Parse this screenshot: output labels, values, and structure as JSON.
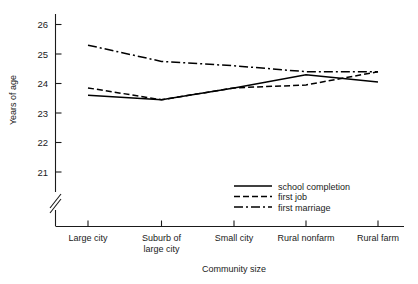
{
  "chart_data": {
    "type": "line",
    "title": "",
    "xlabel": "Community size",
    "ylabel": "Years of age",
    "categories": [
      "Large city",
      "Suburb of large city",
      "Small city",
      "Rural nonfarm",
      "Rural farm"
    ],
    "category_lines": [
      [
        "Large city"
      ],
      [
        "Suburb of",
        "large city"
      ],
      [
        "Small city"
      ],
      [
        "Rural nonfarm"
      ],
      [
        "Rural farm"
      ]
    ],
    "ylim": [
      20.6,
      26.4
    ],
    "yticks": [
      21,
      22,
      23,
      24,
      25,
      26
    ],
    "ytick_labels": [
      "21",
      "22",
      "23",
      "24",
      "25",
      "26"
    ],
    "y_axis_break": true,
    "grid": false,
    "legend_position": "inside-lower-right",
    "series": [
      {
        "name": "school completion",
        "style": "solid",
        "values": [
          23.6,
          23.45,
          23.85,
          24.3,
          24.05
        ]
      },
      {
        "name": "first job",
        "style": "dashed",
        "values": [
          23.85,
          23.45,
          23.85,
          23.95,
          24.4
        ]
      },
      {
        "name": "first marriage",
        "style": "dash-dot",
        "values": [
          25.3,
          24.75,
          24.6,
          24.4,
          24.4
        ]
      }
    ]
  },
  "legend": {
    "entries": [
      {
        "label": "school completion",
        "style": "solid"
      },
      {
        "label": "first job",
        "style": "dashed"
      },
      {
        "label": "first marriage",
        "style": "dash-dot"
      }
    ]
  },
  "axes": {
    "y_title": "Years of age",
    "x_title": "Community size"
  }
}
